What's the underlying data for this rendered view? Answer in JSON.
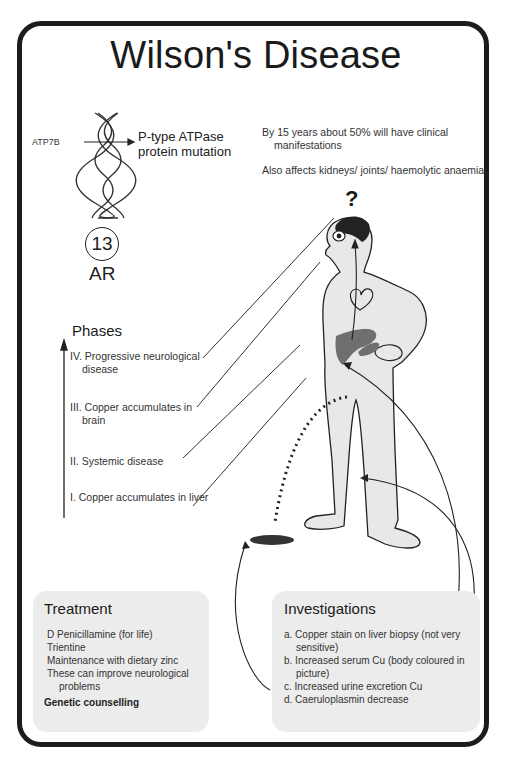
{
  "title": "Wilson's Disease",
  "genetics": {
    "gene": "ATP7B",
    "protein_line1": "P-type ATPase",
    "protein_line2": "protein mutation",
    "chromosome": "13",
    "inheritance": "AR"
  },
  "facts": [
    "By 15 years about 50% will have clinical manifestations",
    "Also affects kidneys/ joints/ haemolytic anaemia"
  ],
  "question_mark": "?",
  "phases": {
    "title": "Phases",
    "items": [
      "IV. Progressive neurological disease",
      "III. Copper accumulates in brain",
      "II.  Systemic disease",
      "I.  Copper accumulates in liver"
    ]
  },
  "treatment": {
    "title": "Treatment",
    "items": [
      "D Penicillamine (for life)",
      "Trientine",
      "Maintenance with dietary zinc",
      "These can improve neurological problems"
    ],
    "footer": "Genetic counselling"
  },
  "investigations": {
    "title": "Investigations",
    "items": [
      "a. Copper stain on liver biopsy (not very sensitive)",
      "b. Increased serum Cu (body coloured in picture)",
      "c. Increased urine excretion Cu",
      "d. Caeruloplasmin decrease"
    ]
  },
  "colors": {
    "frame": "#1c1c1c",
    "body_fill": "#e8e8e8",
    "liver": "#6f6f6f",
    "brain": "#222222",
    "box_bg": "#ececec"
  }
}
